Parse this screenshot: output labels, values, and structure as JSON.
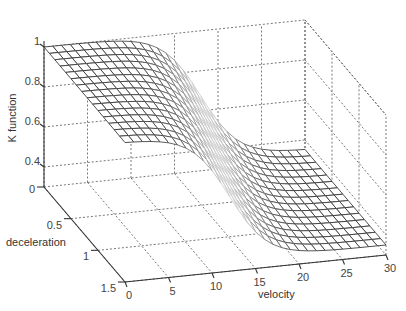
{
  "chart_data": {
    "type": "surface3d",
    "title": "",
    "xlabel": "velocity",
    "ylabel": "deceleration",
    "zlabel": "K function",
    "x_ticks": [
      0,
      5,
      10,
      15,
      20,
      25,
      30
    ],
    "y_ticks": [
      0,
      0.5,
      1,
      1.5
    ],
    "z_ticks": [
      0.4,
      0.6,
      0.8,
      1
    ],
    "z_tick_labels": [
      "0.4",
      "0.6",
      "0.8",
      "1"
    ],
    "y_tick_labels": [
      "0",
      "0.5",
      "1",
      "1.5"
    ],
    "x_tick_labels": [
      "0",
      "5",
      "10",
      "15",
      "20",
      "25",
      "30"
    ],
    "xlim": [
      0,
      30
    ],
    "ylim": [
      0,
      1.5
    ],
    "zlim": [
      0.3,
      1
    ],
    "grid": true,
    "surface": {
      "description": "K approx 1 at low velocity, smooth sigmoid drop to ~0.35 at high velocity; transition centered near velocity 16-20, shifting with deceleration",
      "x_range": [
        0,
        30
      ],
      "y_range": [
        0,
        1.5
      ],
      "x_steps": 30,
      "y_steps": 15,
      "z_high": 1.0,
      "z_low": 0.35,
      "center_at_y0": 18,
      "center_at_y1_5": 12,
      "steepness": 0.45
    }
  },
  "colors": {
    "mesh_edge": "#3a3a3a",
    "face": "#ffffff",
    "axis": "#333333",
    "grid": "#555555"
  }
}
